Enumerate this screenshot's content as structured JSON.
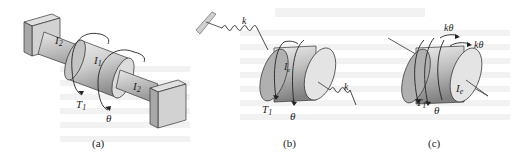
{
  "figures": [
    {
      "id": "a",
      "caption": "(a)",
      "labels": {
        "shaft_left": "I",
        "shaft_left_sub": "2",
        "disk": "I",
        "disk_sub": "1",
        "shaft_right": "I",
        "shaft_right_sub": "2",
        "torque": "T",
        "torque_sub": "1",
        "angle": "θ"
      }
    },
    {
      "id": "b",
      "caption": "(b)",
      "labels": {
        "spring_left": "k",
        "spring_right": "k",
        "disk": "I",
        "disk_sub": "e",
        "torque": "T",
        "torque_sub": "1",
        "angle": "θ"
      }
    },
    {
      "id": "c",
      "caption": "(c)",
      "labels": {
        "spring_moment_1": "kθ",
        "spring_moment_2": "kθ",
        "disk": "I",
        "disk_sub": "e",
        "torque": "T",
        "torque_sub": "1",
        "angle": "θ"
      }
    }
  ],
  "colors": {
    "ink": "#222222",
    "body_light": "#e6e6e6",
    "body_mid": "#bdbdbd",
    "body_dark": "#8f8f8f",
    "wall": "#cfcfcf",
    "ghost_text": "#f3f3f3"
  }
}
